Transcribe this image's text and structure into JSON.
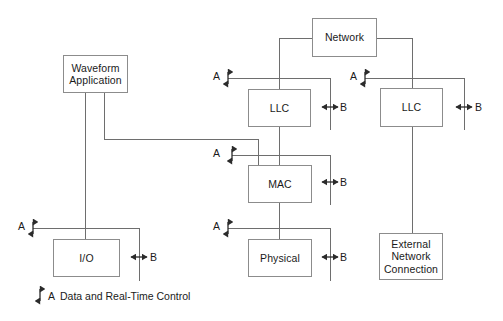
{
  "diagram": {
    "colors": {
      "line": "#6e6e6e",
      "box_border": "#8c8c8c",
      "text": "#1a1a1a",
      "arrow": "#2b2b2b",
      "background": "#ffffff"
    },
    "nodes": [
      {
        "id": "waveform",
        "label": "Waveform\nApplication",
        "x": 63,
        "y": 55,
        "w": 65,
        "h": 38
      },
      {
        "id": "io",
        "label": "I/O",
        "x": 53,
        "y": 239,
        "w": 67,
        "h": 38
      },
      {
        "id": "network",
        "label": "Network",
        "x": 312,
        "y": 18,
        "w": 65,
        "h": 39
      },
      {
        "id": "llc_left",
        "label": "LLC",
        "x": 248,
        "y": 89,
        "w": 63,
        "h": 38
      },
      {
        "id": "mac",
        "label": "MAC",
        "x": 248,
        "y": 165,
        "w": 64,
        "h": 38
      },
      {
        "id": "physical",
        "label": "Physical",
        "x": 248,
        "y": 239,
        "w": 64,
        "h": 38
      },
      {
        "id": "llc_right",
        "label": "LLC",
        "x": 380,
        "y": 88,
        "w": 63,
        "h": 39
      },
      {
        "id": "external",
        "label": "External\nNetwork\nConnection",
        "x": 379,
        "y": 233,
        "w": 64,
        "h": 47
      }
    ],
    "port_labels": [
      {
        "id": "a-llc-left",
        "text": "A",
        "x": 213,
        "y": 71
      },
      {
        "id": "a-mac",
        "text": "A",
        "x": 213,
        "y": 148
      },
      {
        "id": "a-physical",
        "text": "A",
        "x": 213,
        "y": 221
      },
      {
        "id": "a-io",
        "text": "A",
        "x": 18,
        "y": 221
      },
      {
        "id": "a-llc-right",
        "text": "A",
        "x": 350,
        "y": 71
      },
      {
        "id": "b-llc-left",
        "text": "B",
        "x": 340,
        "y": 102
      },
      {
        "id": "b-mac",
        "text": "B",
        "x": 340,
        "y": 177
      },
      {
        "id": "b-physical",
        "text": "B",
        "x": 340,
        "y": 252
      },
      {
        "id": "b-io",
        "text": "B",
        "x": 150,
        "y": 252
      },
      {
        "id": "b-llc-right",
        "text": "B",
        "x": 475,
        "y": 102
      }
    ],
    "legend": {
      "label": "A",
      "description": "Data and Real-Time Control",
      "label_x": 48,
      "text_x": 60,
      "y": 290
    }
  }
}
